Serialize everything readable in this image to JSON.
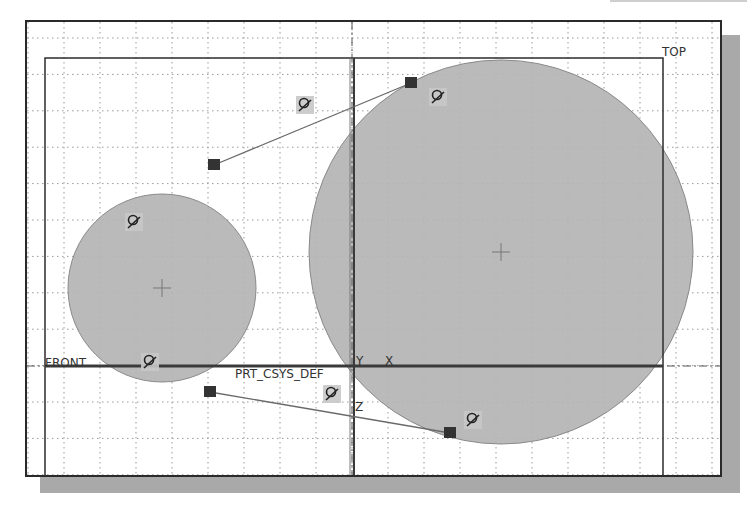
{
  "window": {
    "type": "CAD sketch viewport",
    "background": "#ffffff",
    "frame_color": "#2a2a2a",
    "shadow_color": "#a9a9a9"
  },
  "datum_planes": {
    "front_label": "FRONT",
    "top_label": "TOP"
  },
  "coordinate_system": {
    "name": "PRT_CSYS_DEF",
    "axis_y": "Y",
    "axis_x": "X",
    "axis_z": "Z"
  },
  "sketch": {
    "fill_color": "#b4b4b4",
    "circles": [
      {
        "name": "small-circle",
        "cx": 162,
        "cy": 288,
        "r": 94
      },
      {
        "name": "large-circle",
        "cx": 501,
        "cy": 252,
        "r": 192
      }
    ],
    "tangent_lines": [
      {
        "name": "upper-tangent-line",
        "x1": 214,
        "y1": 165,
        "x2": 411,
        "y2": 83
      },
      {
        "name": "lower-tangent-line",
        "x1": 210,
        "y1": 392,
        "x2": 450,
        "y2": 433
      }
    ],
    "endpoints": [
      {
        "name": "upper-line-start-point",
        "x": 214,
        "y": 165
      },
      {
        "name": "upper-line-end-point",
        "x": 411,
        "y": 83
      },
      {
        "name": "lower-line-start-point",
        "x": 210,
        "y": 392
      },
      {
        "name": "lower-line-end-point",
        "x": 450,
        "y": 433
      }
    ],
    "constraint_icons": [
      {
        "name": "tangent-constraint-icon",
        "x": 305,
        "y": 105
      },
      {
        "name": "tangent-constraint-icon",
        "x": 438,
        "y": 97
      },
      {
        "name": "tangent-constraint-icon",
        "x": 134,
        "y": 222
      },
      {
        "name": "tangent-constraint-icon",
        "x": 150,
        "y": 362
      },
      {
        "name": "tangent-constraint-icon",
        "x": 332,
        "y": 394
      },
      {
        "name": "tangent-constraint-icon",
        "x": 473,
        "y": 420
      }
    ]
  }
}
